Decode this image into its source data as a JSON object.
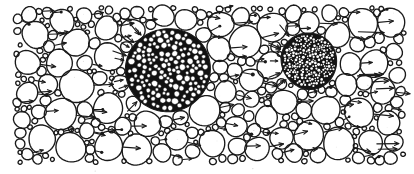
{
  "figure": {
    "title": "Hand-drawn particle dispersion / agglomeration schematic",
    "type": "technical-illustration",
    "medium": "scanned ink line drawing",
    "canvas": {
      "width": 414,
      "height": 174,
      "background_color": "#ffffff",
      "ink_color": "#1a1a1a",
      "margins": {
        "left": 18,
        "right": 12,
        "top": 8,
        "bottom": 16
      }
    },
    "flow_direction": "left-to-right",
    "elements": {
      "open_particles_label": "outlined circle particles",
      "vector_label": "velocity arrows",
      "agglomerate_label": "dark agglomerate cluster",
      "tracer_label": "small filled tracer dots"
    },
    "agglomerates": [
      {
        "name": "primary-agglomerate",
        "cx": 168,
        "cy": 70,
        "r": 42,
        "fill": "#111111",
        "inner_particle_radius_range": [
          1.6,
          3.4
        ],
        "inner_particle_count": 150,
        "inner_fill": "#ffffff",
        "note": "large coarse-packed cluster, left of centre"
      },
      {
        "name": "secondary-agglomerate",
        "cx": 309,
        "cy": 61,
        "r": 28,
        "fill": "#141414",
        "inner_particle_radius_range": [
          0.7,
          1.5
        ],
        "inner_particle_count": 230,
        "inner_fill": "#ffffff",
        "note": "smaller, much finer-grained cluster, right of centre"
      }
    ],
    "stroke": {
      "particle_width": 1.35,
      "arrow_width": 1.15,
      "agglomerate_edge_width": 1.1
    },
    "particle_size_range": {
      "min_radius": 2.0,
      "max_radius": 17.0
    },
    "counts": {
      "open_particles": 196,
      "arrows": 74,
      "tracer_dots": 22,
      "agglomerates": 2
    }
  }
}
